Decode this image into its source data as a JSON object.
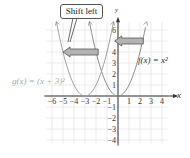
{
  "chart_data": {
    "type": "line",
    "title": "",
    "xlabel": "x",
    "ylabel": "y",
    "xlim": [
      -6,
      4
    ],
    "ylim": [
      -4,
      6
    ],
    "grid": true,
    "x_ticks": [
      "-6",
      "-5",
      "-4",
      "-3",
      "-2",
      "-1",
      "1",
      "2",
      "3",
      "4"
    ],
    "y_ticks": [
      "6",
      "4",
      "3",
      "2",
      "1",
      "-1",
      "-2",
      "-3",
      "-4"
    ],
    "series": [
      {
        "name": "f(x) = x²",
        "formula": "x^2",
        "vertex": [
          0,
          0
        ],
        "color": "#8a8a8a"
      },
      {
        "name": "g(x) = (x + 3)²",
        "formula": "(x+3)^2",
        "vertex": [
          -3,
          0
        ],
        "color": "#8a8a8a"
      }
    ],
    "annotations": [
      {
        "text": "Shift left",
        "type": "callout"
      },
      {
        "type": "arrow",
        "direction": "left",
        "from_x": 2.3,
        "to_x": -0.3,
        "y": 5
      },
      {
        "type": "arrow",
        "direction": "left",
        "from_x": -1.8,
        "to_x": -5,
        "y": 4
      }
    ]
  },
  "labels": {
    "callout": "Shift left",
    "f_label": "f(x) = x²",
    "g_label": "g(x) = (x + 3)²",
    "x_axis": "x",
    "y_axis": "y"
  }
}
